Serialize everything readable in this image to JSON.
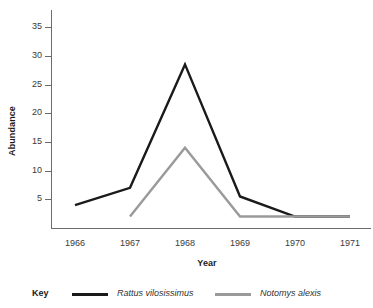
{
  "chart_data": {
    "type": "line",
    "title": "",
    "xlabel": "Year",
    "ylabel": "Abundance",
    "categories": [
      "1966",
      "1967",
      "1968",
      "1969",
      "1970",
      "1971"
    ],
    "x": [
      1966,
      1967,
      1968,
      1969,
      1970,
      1971
    ],
    "xlim": [
      1965.6,
      1971.6
    ],
    "ylim": [
      0,
      38
    ],
    "grid": false,
    "legend_position": "bottom",
    "legend_title": "Key",
    "y_ticks": [
      5,
      10,
      15,
      20,
      25,
      30,
      35
    ],
    "y_tick_labels": [
      "5",
      "10",
      "15",
      "20",
      "25",
      "30",
      "35"
    ],
    "series": [
      {
        "name": "Rattus vilosissimus",
        "color": "#1a1a1a",
        "values": [
          4,
          7,
          28.5,
          5.5,
          2,
          2
        ]
      },
      {
        "name": "Notomys alexis",
        "color": "#9a9a9a",
        "values": [
          null,
          2,
          14,
          2,
          2,
          2
        ]
      }
    ]
  },
  "axes": {
    "y_title": "Abundance",
    "x_title": "Year",
    "axis_color": "#6b6b6b",
    "tick_label_color": "#3a3a3a"
  },
  "legend": {
    "title": "Key",
    "entries": [
      {
        "label": "Rattus vilosissimus",
        "color": "#1a1a1a"
      },
      {
        "label": "Notomys alexis",
        "color": "#9a9a9a"
      }
    ]
  }
}
